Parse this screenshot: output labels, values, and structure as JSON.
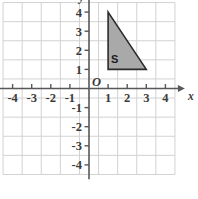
{
  "chart_data": {
    "type": "scatter",
    "title": "",
    "xlabel": "x",
    "ylabel": "y",
    "xlim": [
      -4.6,
      4.6
    ],
    "ylim": [
      -4.6,
      4.6
    ],
    "grid": true,
    "legend": "none",
    "origin_label": "O",
    "xticks": [
      -4,
      -3,
      -2,
      -1,
      1,
      2,
      3,
      4
    ],
    "yticks": [
      4,
      3,
      2,
      1,
      -1,
      -2,
      -3,
      -4
    ],
    "xtick_labels": [
      "-4",
      "-3",
      "-2",
      "-1",
      "1",
      "2",
      "3",
      "4"
    ],
    "ytick_labels": [
      "4",
      "3",
      "2",
      "1",
      "-1",
      "-2",
      "-3",
      "-4"
    ],
    "shapes": [
      {
        "name": "S",
        "label": "S",
        "kind": "triangle",
        "vertices": [
          [
            1,
            4
          ],
          [
            1,
            1
          ],
          [
            3,
            1
          ]
        ],
        "fill": "#a9a9a9",
        "stroke": "#2b2b2b",
        "label_position": [
          1.35,
          1.55
        ]
      }
    ],
    "axis_arrows": [
      "x-positive",
      "y-positive"
    ],
    "grid_x_range": [
      -4.5,
      4.5
    ],
    "grid_y_range": [
      -4.5,
      4.5
    ],
    "colors": {
      "grid": "#d2d2d2",
      "axis": "#58585a",
      "shape_fill": "#a9a9a9",
      "shape_stroke": "#2b2b2b",
      "text": "#3a3a3a",
      "background": "#ffffff"
    }
  }
}
